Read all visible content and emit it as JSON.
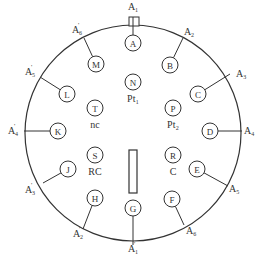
{
  "diagram": {
    "type": "connector-pin-layout",
    "outer_circle": {
      "cx": 133,
      "cy": 133,
      "r": 108
    },
    "pins": [
      {
        "id": "A",
        "x": 133,
        "y": 43,
        "external": "A1",
        "sub": "1",
        "prime": false,
        "lx": 133,
        "ly": 10,
        "ex": 133,
        "ey": 17,
        "anchor": "middle"
      },
      {
        "id": "B",
        "x": 170,
        "y": 65,
        "external": "A2",
        "sub": "2",
        "prime": false,
        "lx": 189,
        "ly": 35,
        "ex": 183,
        "ey": 38,
        "anchor": "middle"
      },
      {
        "id": "C",
        "x": 198,
        "y": 94,
        "external": "A3",
        "sub": "3",
        "prime": false,
        "lx": 236,
        "ly": 77,
        "ex": 230,
        "ey": 74,
        "anchor": "start"
      },
      {
        "id": "D",
        "x": 210,
        "y": 131,
        "external": "A4",
        "sub": "4",
        "prime": false,
        "lx": 244,
        "ly": 134,
        "ex": 242,
        "ey": 131,
        "anchor": "start"
      },
      {
        "id": "E",
        "x": 197,
        "y": 169,
        "external": "A5",
        "sub": "5",
        "prime": false,
        "lx": 229,
        "ly": 192,
        "ex": 228,
        "ey": 186,
        "anchor": "start"
      },
      {
        "id": "F",
        "x": 172,
        "y": 199,
        "external": "A6",
        "sub": "6",
        "prime": false,
        "lx": 186,
        "ly": 234,
        "ex": 184,
        "ey": 225,
        "anchor": "start"
      },
      {
        "id": "G",
        "x": 133,
        "y": 208,
        "external": "A1'",
        "sub": "1",
        "prime": true,
        "lx": 133,
        "ly": 252,
        "ex": 133,
        "ey": 245,
        "anchor": "middle"
      },
      {
        "id": "H",
        "x": 95,
        "y": 198,
        "external": "A2'",
        "sub": "2",
        "prime": true,
        "lx": 78,
        "ly": 237,
        "ex": 83,
        "ey": 229,
        "anchor": "middle"
      },
      {
        "id": "J",
        "x": 68,
        "y": 169,
        "external": "A3'",
        "sub": "3",
        "prime": true,
        "lx": 30,
        "ly": 193,
        "ex": 43,
        "ey": 183,
        "anchor": "middle"
      },
      {
        "id": "K",
        "x": 58,
        "y": 131,
        "external": "A4'",
        "sub": "4",
        "prime": true,
        "lx": 13,
        "ly": 134,
        "ex": 24,
        "ey": 131,
        "anchor": "middle"
      },
      {
        "id": "L",
        "x": 67,
        "y": 94,
        "external": "A5'",
        "sub": "5",
        "prime": true,
        "lx": 30,
        "ly": 75,
        "ex": 40,
        "ey": 77,
        "anchor": "middle"
      },
      {
        "id": "M",
        "x": 96,
        "y": 64,
        "external": "A6'",
        "sub": "6",
        "prime": true,
        "lx": 77,
        "ly": 33,
        "ex": 84,
        "ey": 38,
        "anchor": "middle"
      }
    ],
    "inner_pins": [
      {
        "id": "N",
        "x": 133,
        "y": 82,
        "label": "Pt₁"
      },
      {
        "id": "P",
        "x": 173,
        "y": 108,
        "label": "Pt₂"
      },
      {
        "id": "T",
        "x": 95,
        "y": 108,
        "label": "nc"
      },
      {
        "id": "S",
        "x": 95,
        "y": 155,
        "label": "RC"
      },
      {
        "id": "R",
        "x": 173,
        "y": 155,
        "label": "C"
      }
    ],
    "key_slot": {
      "x": 129,
      "y": 150,
      "w": 8,
      "h": 43
    },
    "top_key": {
      "x": 129,
      "y": 17,
      "w": 10,
      "h": 9
    },
    "pin_radius": 8,
    "stroke_color": "#333333"
  }
}
